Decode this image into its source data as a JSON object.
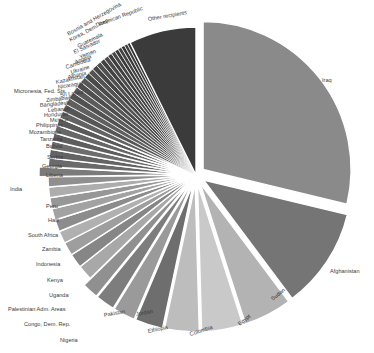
{
  "chart_data": {
    "type": "pie",
    "title": "",
    "subtitle": "",
    "xlabel": "",
    "ylabel": "",
    "legend_position": "none",
    "grid": false,
    "note": "Exploded grayscale pie chart of aid/assistance share by recipient country. Slices ordered clockwise from top, descending by value. Only the largest slices carry readable labels; the many small slices have overlapping labels near the top-left rim.",
    "center": [
      196,
      175
    ],
    "radius": 148,
    "start_angle_deg": -90,
    "categories": [
      "Iraq",
      "Afghanistan",
      "Sudan",
      "Egypt",
      "Colombia",
      "Ethiopia",
      "Jordan",
      "Pakistan",
      "Nigeria",
      "Congo, Dem. Rep.",
      "Palestinian Adm. Areas",
      "Uganda",
      "Kenya",
      "Indonesia",
      "Zambia",
      "South Africa",
      "Haiti",
      "Peru",
      "India",
      "Liberia",
      "Georgia",
      "Serbia",
      "Bolivia",
      "Tanzania",
      "Mozambique",
      "Philippines",
      "Mexico",
      "Honduras",
      "Lebanon",
      "Bangladesh",
      "Zimbabwe",
      "Sri Lanka",
      "Micronesia, Fed. Sts.",
      "Nicaragua",
      "Kazakhstan",
      "Albania",
      "Ukraine",
      "Cambodia",
      "Angola",
      "Yemen",
      "El Salvador",
      "Guatemala",
      "Korea, Dem. Rep.",
      "Bosnia and Herzegovina",
      "Dominican Republic",
      "Other recipients"
    ],
    "values": [
      27.4,
      10.5,
      5.0,
      4.3,
      3.6,
      2.9,
      2.3,
      2.0,
      1.7,
      1.6,
      1.5,
      1.4,
      1.3,
      1.25,
      1.2,
      1.15,
      1.1,
      1.05,
      1.0,
      0.95,
      0.9,
      0.88,
      0.85,
      0.82,
      0.8,
      0.78,
      0.75,
      0.72,
      0.7,
      0.68,
      0.65,
      0.62,
      0.6,
      0.58,
      0.55,
      0.52,
      0.5,
      0.48,
      0.45,
      0.42,
      0.4,
      0.38,
      0.36,
      0.34,
      0.32,
      7.0
    ],
    "slice_colors": [
      "#8a8a8a",
      "#757575",
      "#b3b3b3",
      "#c9c9c9",
      "#bdbdbd",
      "#6e6e6e",
      "#9a9a9a",
      "#7d7d7d",
      "#909090",
      "#a8a8a8",
      "#868686",
      "#9e9e9e",
      "#b0b0b0",
      "#8c8c8c",
      "#a2a2a2",
      "#979797",
      "#adadad",
      "#8f8f8f",
      "#7a7a7a",
      "#6a6a6a",
      "#636363",
      "#6d6d6d",
      "#5e5e5e",
      "#676767",
      "#5a5a5a",
      "#626262",
      "#565656",
      "#5f5f5f",
      "#525252",
      "#5b5b5b",
      "#4e4e4e",
      "#575757",
      "#4a4a4a",
      "#535353",
      "#464646",
      "#4f4f4f",
      "#424242",
      "#4b4b4b",
      "#3e3e3e",
      "#474747",
      "#3a3a3a",
      "#434343",
      "#363636",
      "#3f3f3f",
      "#323232",
      "#3b3b3b"
    ],
    "exploded": [
      true,
      true,
      true,
      true,
      true,
      true,
      true,
      true,
      true,
      false,
      false,
      false,
      false,
      false,
      false,
      false,
      false,
      false,
      true,
      false,
      false,
      false,
      false,
      false,
      false,
      false,
      false,
      false,
      false,
      false,
      false,
      false,
      false,
      false,
      false,
      false,
      false,
      false,
      false,
      false,
      false,
      false,
      false,
      false,
      false,
      false
    ],
    "labels": [
      {
        "text": "Iraq",
        "x": 322,
        "y": 81,
        "size": 5.6,
        "rot": 0,
        "anchor": "start"
      },
      {
        "text": "Afghanistan",
        "x": 330,
        "y": 272,
        "size": 5.6,
        "rot": 0,
        "anchor": "start"
      },
      {
        "text": "Sudan",
        "x": 272,
        "y": 300,
        "size": 5.6,
        "rot": -38,
        "anchor": "start"
      },
      {
        "text": "Egypt",
        "x": 239,
        "y": 325,
        "size": 5.6,
        "rot": -38,
        "anchor": "start"
      },
      {
        "text": "Colombia",
        "x": 190,
        "y": 335,
        "size": 5.6,
        "rot": -18,
        "anchor": "start"
      },
      {
        "text": "Ethiopia",
        "x": 148,
        "y": 332,
        "size": 5.6,
        "rot": -12,
        "anchor": "start"
      },
      {
        "text": "Jordan",
        "x": 136,
        "y": 315,
        "size": 5.6,
        "rot": -10,
        "anchor": "start"
      },
      {
        "text": "Pakistan",
        "x": 104,
        "y": 316,
        "size": 5.6,
        "rot": -10,
        "anchor": "start"
      },
      {
        "text": "Nigeria",
        "x": 60,
        "y": 341,
        "size": 5.6,
        "rot": 0,
        "anchor": "start"
      },
      {
        "text": "Congo, Dem. Rep.",
        "x": 24,
        "y": 325,
        "size": 5.6,
        "rot": 0,
        "anchor": "start"
      },
      {
        "text": "Palestinian Adm. Areas",
        "x": 8,
        "y": 310,
        "size": 5.6,
        "rot": 0,
        "anchor": "start"
      },
      {
        "text": "Uganda",
        "x": 49,
        "y": 296,
        "size": 5.6,
        "rot": 0,
        "anchor": "start"
      },
      {
        "text": "Kenya",
        "x": 47,
        "y": 281,
        "size": 5.6,
        "rot": 0,
        "anchor": "start"
      },
      {
        "text": "Indonesia",
        "x": 36,
        "y": 265,
        "size": 5.6,
        "rot": 0,
        "anchor": "start"
      },
      {
        "text": "Zambia",
        "x": 42,
        "y": 250,
        "size": 5.6,
        "rot": 0,
        "anchor": "start"
      },
      {
        "text": "South Africa",
        "x": 28,
        "y": 236,
        "size": 5.6,
        "rot": 0,
        "anchor": "start"
      },
      {
        "text": "Haiti",
        "x": 48,
        "y": 221,
        "size": 5.6,
        "rot": 0,
        "anchor": "start"
      },
      {
        "text": "Peru",
        "x": 46,
        "y": 207,
        "size": 5.6,
        "rot": 0,
        "anchor": "start"
      },
      {
        "text": "India",
        "x": 10,
        "y": 190,
        "size": 5.6,
        "rot": 0,
        "anchor": "start"
      },
      {
        "text": "Liberia",
        "x": 46,
        "y": 176,
        "size": 5.6,
        "rot": 0,
        "anchor": "start"
      },
      {
        "text": "Georgia",
        "x": 42,
        "y": 167,
        "size": 5.6,
        "rot": 0,
        "anchor": "start"
      },
      {
        "text": "Serbia",
        "x": 47,
        "y": 158,
        "size": 5.6,
        "rot": 0,
        "anchor": "start"
      },
      {
        "text": "Bolivia",
        "x": 46,
        "y": 147,
        "size": 5.6,
        "rot": 0,
        "anchor": "start"
      },
      {
        "text": "Tanzania",
        "x": 40,
        "y": 140,
        "size": 5.6,
        "rot": 0,
        "anchor": "start"
      },
      {
        "text": "Mozambique",
        "x": 29,
        "y": 133,
        "size": 5.6,
        "rot": 0,
        "anchor": "start"
      },
      {
        "text": "Philippines",
        "x": 36,
        "y": 126,
        "size": 5.6,
        "rot": 0,
        "anchor": "start"
      },
      {
        "text": "Mexico",
        "x": 50,
        "y": 121,
        "size": 5.6,
        "rot": -3,
        "anchor": "start"
      },
      {
        "text": "Honduras",
        "x": 44,
        "y": 116,
        "size": 5.6,
        "rot": -3,
        "anchor": "start"
      },
      {
        "text": "Lebanon",
        "x": 48,
        "y": 111,
        "size": 5.6,
        "rot": -4,
        "anchor": "start"
      },
      {
        "text": "Bangladesh",
        "x": 40,
        "y": 106,
        "size": 5.6,
        "rot": -5,
        "anchor": "start"
      },
      {
        "text": "Zimbabwe",
        "x": 46,
        "y": 101,
        "size": 5.6,
        "rot": -6,
        "anchor": "start"
      },
      {
        "text": "Sri Lanka",
        "x": 60,
        "y": 96,
        "size": 5.6,
        "rot": -8,
        "anchor": "start"
      },
      {
        "text": "Micronesia, Fed. Sts.",
        "x": 14,
        "y": 92,
        "size": 5.6,
        "rot": 0,
        "anchor": "start"
      },
      {
        "text": "Nicaragua",
        "x": 58,
        "y": 88,
        "size": 5.6,
        "rot": -10,
        "anchor": "start"
      },
      {
        "text": "Kazakhstan",
        "x": 56,
        "y": 83,
        "size": 5.6,
        "rot": -12,
        "anchor": "start"
      },
      {
        "text": "Albania",
        "x": 68,
        "y": 78,
        "size": 5.6,
        "rot": -14,
        "anchor": "start"
      },
      {
        "text": "Ukraine",
        "x": 71,
        "y": 73,
        "size": 5.6,
        "rot": -16,
        "anchor": "start"
      },
      {
        "text": "Cambodia",
        "x": 66,
        "y": 68,
        "size": 5.6,
        "rot": -18,
        "anchor": "start"
      },
      {
        "text": "Angola",
        "x": 75,
        "y": 63,
        "size": 5.6,
        "rot": -20,
        "anchor": "start"
      },
      {
        "text": "Yemen",
        "x": 80,
        "y": 58,
        "size": 5.6,
        "rot": -22,
        "anchor": "start"
      },
      {
        "text": "El Salvador",
        "x": 74,
        "y": 53,
        "size": 5.6,
        "rot": -24,
        "anchor": "start"
      },
      {
        "text": "Guatemala",
        "x": 78,
        "y": 47,
        "size": 5.6,
        "rot": -26,
        "anchor": "start"
      },
      {
        "text": "Korea, Dem. Rep.",
        "x": 70,
        "y": 41,
        "size": 5.6,
        "rot": -28,
        "anchor": "start"
      },
      {
        "text": "Bosnia and Herzegovina",
        "x": 68,
        "y": 35,
        "size": 5.6,
        "rot": -30,
        "anchor": "start"
      },
      {
        "text": "Dominican Republic",
        "x": 96,
        "y": 26,
        "size": 5.6,
        "rot": -20,
        "anchor": "start"
      },
      {
        "text": "Other recipients",
        "x": 148,
        "y": 20,
        "size": 5.6,
        "rot": -10,
        "anchor": "start"
      }
    ]
  }
}
